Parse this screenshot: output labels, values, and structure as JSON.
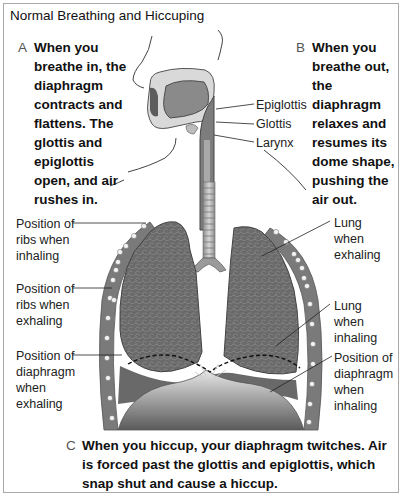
{
  "title": "Normal Breathing and Hiccuping",
  "captions": {
    "a": {
      "letter": "A",
      "lines": [
        "When you",
        "breathe in, the",
        "diaphragm",
        "contracts and",
        "flattens. The",
        "glottis and",
        "epiglottis",
        "open, and air",
        "rushes in."
      ]
    },
    "b": {
      "letter": "B",
      "lines": [
        "When you",
        "breathe out,",
        "the diaphragm",
        "relaxes and",
        "resumes its",
        "dome shape,",
        "pushing the",
        "air out."
      ]
    },
    "c": {
      "letter": "C",
      "lines": [
        "When you hiccup, your diaphragm twitches. Air",
        "is forced past the glottis and epiglottis, which",
        "snap shut and cause a hiccup."
      ]
    }
  },
  "labels": {
    "epiglottis": "Epiglottis",
    "glottis": "Glottis",
    "larynx": "Larynx",
    "ribs_inhaling": [
      "Position of",
      "ribs when",
      "inhaling"
    ],
    "ribs_exhaling": [
      "Position of",
      "ribs when",
      "exhaling"
    ],
    "diaphragm_exhaling": [
      "Position of",
      "diaphragm",
      "when",
      "exhaling"
    ],
    "lung_exhaling": [
      "Lung",
      "when",
      "exhaling"
    ],
    "lung_inhaling": [
      "Lung",
      "when",
      "inhaling"
    ],
    "diaphragm_inhaling": [
      "Position of",
      "diaphragm",
      "when",
      "inhaling"
    ]
  },
  "colors": {
    "border": "#a9a9a9",
    "lung": "#6e6e6e",
    "lung_dark": "#4f4f4f",
    "rib": "#7a7a7a",
    "diaphragm": "#9a9a9a",
    "trachea": "#b0b0b0",
    "head": "#8a8a8a"
  }
}
